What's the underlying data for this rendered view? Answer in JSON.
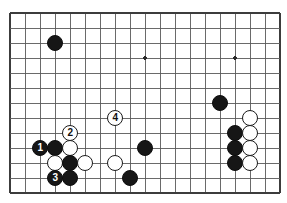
{
  "figure": {
    "kind": "go-board-diagram",
    "board": {
      "origin_x": 10,
      "origin_y": 13,
      "cell": 15,
      "cols": 18,
      "rows": 12,
      "line_color": "#5a5a5a",
      "edge_color": "#3c3c3c",
      "background_color": "#ffffff",
      "star_point_color": "#2a2a2a",
      "star_points": [
        {
          "col": 9,
          "row": 3
        },
        {
          "col": 15,
          "row": 3
        }
      ]
    },
    "stone_radius": 8.2,
    "colors": {
      "black_stone": "#161616",
      "white_stone": "#ffffff",
      "white_stone_border": "#1a1a1a",
      "black_label_text": "#ffffff",
      "white_label_text": "#111111"
    },
    "stones": [
      {
        "id": "black-upper-left",
        "color": "black",
        "col": 3,
        "row": 2,
        "label": ""
      },
      {
        "id": "black-move-1",
        "color": "black",
        "col": 2,
        "row": 9,
        "label": "1"
      },
      {
        "id": "black-left-b",
        "color": "black",
        "col": 3,
        "row": 9,
        "label": ""
      },
      {
        "id": "white-move-2",
        "color": "white",
        "col": 4,
        "row": 8,
        "label": "2"
      },
      {
        "id": "white-left-a",
        "color": "white",
        "col": 4,
        "row": 9,
        "label": ""
      },
      {
        "id": "white-left-b",
        "color": "white",
        "col": 3,
        "row": 10,
        "label": ""
      },
      {
        "id": "black-left-c",
        "color": "black",
        "col": 4,
        "row": 10,
        "label": ""
      },
      {
        "id": "white-left-c",
        "color": "white",
        "col": 5,
        "row": 10,
        "label": ""
      },
      {
        "id": "black-move-3",
        "color": "black",
        "col": 3,
        "row": 11,
        "label": "3"
      },
      {
        "id": "black-left-d",
        "color": "black",
        "col": 4,
        "row": 11,
        "label": ""
      },
      {
        "id": "white-move-4",
        "color": "white",
        "col": 7,
        "row": 7,
        "label": "4"
      },
      {
        "id": "white-center",
        "color": "white",
        "col": 7,
        "row": 10,
        "label": ""
      },
      {
        "id": "black-center-right",
        "color": "black",
        "col": 9,
        "row": 9,
        "label": ""
      },
      {
        "id": "black-center-low",
        "color": "black",
        "col": 8,
        "row": 11,
        "label": ""
      },
      {
        "id": "black-right-upper",
        "color": "black",
        "col": 14,
        "row": 6,
        "label": ""
      },
      {
        "id": "white-right-1",
        "color": "white",
        "col": 16,
        "row": 7,
        "label": ""
      },
      {
        "id": "black-right-1",
        "color": "black",
        "col": 15,
        "row": 8,
        "label": ""
      },
      {
        "id": "white-right-2",
        "color": "white",
        "col": 16,
        "row": 8,
        "label": ""
      },
      {
        "id": "black-right-2",
        "color": "black",
        "col": 15,
        "row": 9,
        "label": ""
      },
      {
        "id": "white-right-3",
        "color": "white",
        "col": 16,
        "row": 9,
        "label": ""
      },
      {
        "id": "black-right-3",
        "color": "black",
        "col": 15,
        "row": 10,
        "label": ""
      },
      {
        "id": "white-right-4",
        "color": "white",
        "col": 16,
        "row": 10,
        "label": ""
      }
    ],
    "move_sequence": [
      {
        "number": "1",
        "color": "black"
      },
      {
        "number": "2",
        "color": "white"
      },
      {
        "number": "3",
        "color": "black"
      },
      {
        "number": "4",
        "color": "white"
      }
    ]
  }
}
